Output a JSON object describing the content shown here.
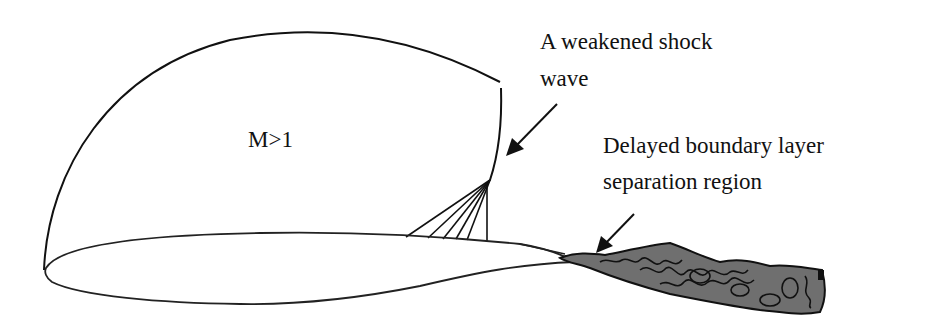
{
  "diagram": {
    "region_label": "M>1",
    "shock_label": {
      "line1": "A weakened shock",
      "line2": "wave"
    },
    "separation_label": {
      "line1": "Delayed boundary layer",
      "line2": "separation region"
    }
  },
  "colors": {
    "stroke": "#111111",
    "wake_fill": "#6f6f6f",
    "background": "#ffffff"
  }
}
